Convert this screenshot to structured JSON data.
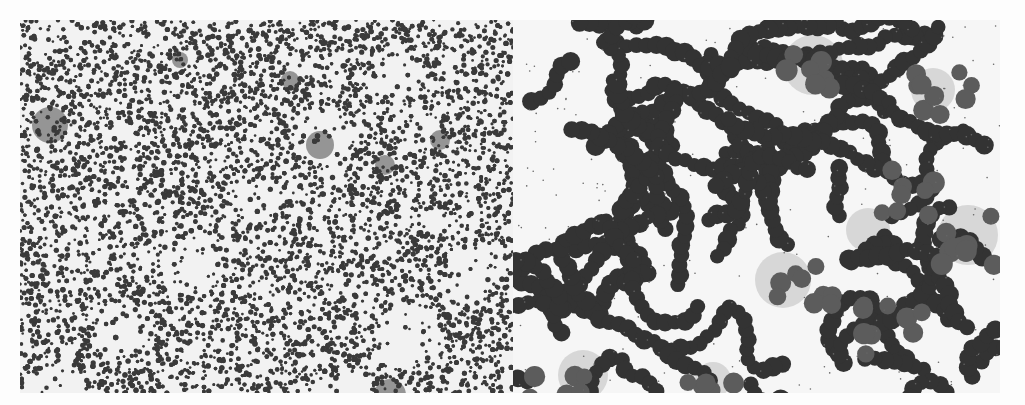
{
  "figure": {
    "panels": [
      {
        "id": "left",
        "view": "low magnification",
        "content": "densely packed small dark cells with scattered lighter gray patches",
        "colors": {
          "background": "#f2f2f2",
          "cell": "#3a3a3a",
          "patch": "#6e6e6e"
        }
      },
      {
        "id": "right",
        "view": "high magnification",
        "content": "chains and clusters of dark round cells with lighter gray cell groups on pale background",
        "colors": {
          "background": "#f6f6f6",
          "cell_dark": "#333333",
          "cell_mid": "#5c5c5c",
          "stain_patch": "#bdbdbd"
        }
      }
    ]
  }
}
